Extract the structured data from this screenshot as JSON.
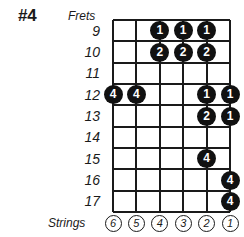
{
  "diagram": {
    "number_label": "#4",
    "frets_axis_label": "Frets",
    "strings_axis_label": "Strings",
    "ink_color": "#111111",
    "paper_color": "#ffffff"
  },
  "chart_data": {
    "type": "table",
    "title": "#4",
    "xlabel": "Strings",
    "ylabel": "Frets",
    "grid": true,
    "legend": "none",
    "frets": [
      9,
      10,
      11,
      12,
      13,
      14,
      15,
      16,
      17
    ],
    "strings": [
      6,
      5,
      4,
      3,
      2,
      1
    ],
    "fret_labels": [
      "9",
      "10",
      "11",
      "12",
      "13",
      "14",
      "15",
      "16",
      "17"
    ],
    "string_labels": [
      "6",
      "5",
      "4",
      "3",
      "2",
      "1"
    ],
    "markers": [
      {
        "fret": 9,
        "string": 4,
        "finger": "1"
      },
      {
        "fret": 9,
        "string": 3,
        "finger": "1"
      },
      {
        "fret": 9,
        "string": 2,
        "finger": "1"
      },
      {
        "fret": 10,
        "string": 4,
        "finger": "2"
      },
      {
        "fret": 10,
        "string": 3,
        "finger": "2"
      },
      {
        "fret": 10,
        "string": 2,
        "finger": "2"
      },
      {
        "fret": 12,
        "string": 6,
        "finger": "4"
      },
      {
        "fret": 12,
        "string": 5,
        "finger": "4"
      },
      {
        "fret": 12,
        "string": 2,
        "finger": "1"
      },
      {
        "fret": 12,
        "string": 1,
        "finger": "1"
      },
      {
        "fret": 13,
        "string": 2,
        "finger": "2"
      },
      {
        "fret": 13,
        "string": 1,
        "finger": "1"
      },
      {
        "fret": 15,
        "string": 2,
        "finger": "4"
      },
      {
        "fret": 16,
        "string": 1,
        "finger": "4"
      },
      {
        "fret": 17,
        "string": 1,
        "finger": "4"
      }
    ]
  }
}
